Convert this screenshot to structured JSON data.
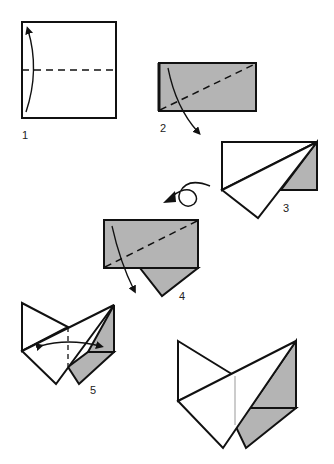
{
  "diagram": {
    "type": "origami-folding-instructions",
    "colors": {
      "paper_front": "#ffffff",
      "paper_back": "#b4b4b4",
      "line": "#111111"
    },
    "steps": [
      {
        "number": "1",
        "description": "Square sheet, valley fold bottom to top along dashed horizontal line"
      },
      {
        "number": "2",
        "description": "Folded rectangle, fold along diagonal dashed line"
      },
      {
        "number": "3",
        "description": "Result after diagonal fold; turn over"
      },
      {
        "number": "4",
        "description": "Turned over, fold along diagonal dashed line"
      },
      {
        "number": "5",
        "description": "Fold and unfold along center line"
      },
      {
        "number": "",
        "description": "Finished model"
      }
    ]
  }
}
